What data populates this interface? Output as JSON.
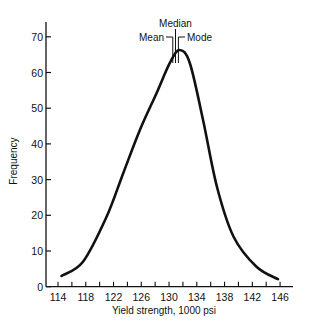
{
  "chart_data": {
    "type": "line",
    "title": "",
    "xlabel": "Yield strength, 1000 psi",
    "ylabel": "Frequency",
    "xlim": [
      113,
      148
    ],
    "ylim": [
      0,
      74
    ],
    "x_ticks": [
      114,
      118,
      122,
      126,
      130,
      134,
      138,
      142,
      146
    ],
    "x_minor_tick_step": 2,
    "y_ticks": [
      0,
      10,
      20,
      30,
      40,
      50,
      60,
      70
    ],
    "grid": false,
    "legend": null,
    "series": [
      {
        "name": "Yield strength distribution",
        "x": [
          114.5,
          117.6,
          121.0,
          123.4,
          125.8,
          128.2,
          130.1,
          131.5,
          133.0,
          134.9,
          136.9,
          139.3,
          142.6,
          145.7
        ],
        "y": [
          3.0,
          7.0,
          19.6,
          31.8,
          43.9,
          54.2,
          62.6,
          66.3,
          62.6,
          46.7,
          28.0,
          14.0,
          5.6,
          2.1
        ]
      }
    ],
    "annotations": [
      {
        "label": "Mean",
        "x": 130.8
      },
      {
        "label": "Median",
        "x": 131.1
      },
      {
        "label": "Mode",
        "x": 131.5
      }
    ]
  },
  "labels": {
    "mean": "Mean",
    "median": "Median",
    "mode": "Mode",
    "xlabel": "Yield strength, 1000 psi",
    "ylabel": "Frequency"
  },
  "colors": {
    "line": "#111111",
    "background": "#ffffff"
  }
}
